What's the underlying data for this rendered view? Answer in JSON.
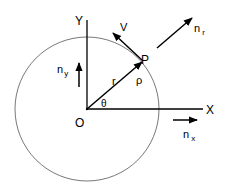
{
  "diagram": {
    "colors": {
      "stroke": "#000000",
      "circle": "#555555",
      "background": "#ffffff"
    },
    "labels": {
      "y_axis": "Y",
      "x_axis": "X",
      "origin": "O",
      "point": "P",
      "velocity": "V",
      "radius": "r",
      "rho": "ρ",
      "theta": "θ",
      "n_r_base": "n",
      "n_r_sub": "r",
      "n_y_base": "n",
      "n_y_sub": "y",
      "n_x_base": "n",
      "n_x_sub": "x"
    }
  }
}
